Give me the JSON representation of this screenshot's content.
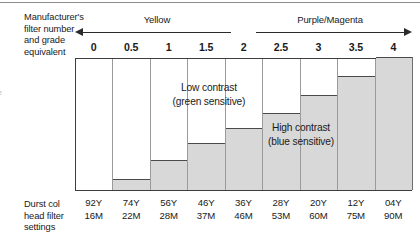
{
  "figure": {
    "left_label_lines": [
      "Manufacturer's",
      "filter number",
      "and grade",
      "equivalent"
    ],
    "bottom_label_lines": [
      "Durst col",
      "head filter",
      "settings"
    ],
    "edge_artifact": "e"
  },
  "bands": [
    {
      "name": "yellow-band",
      "label": "Yellow",
      "arrow": "left",
      "arrow_icon": "arrow-left-icon"
    },
    {
      "name": "purple-band",
      "label": "Purple/Magenta",
      "arrow": "right",
      "arrow_icon": "arrow-right-icon"
    }
  ],
  "annotations": {
    "low_contrast_line1": "Low contrast",
    "low_contrast_line2": "(green sensitive)",
    "high_contrast_line1": "High contrast",
    "high_contrast_line2": "(blue sensitive)"
  },
  "colors": {
    "bar_fill": "#d8d8d8",
    "bar_top_stroke": "#4a4a4a",
    "grid": "#9a9a9a",
    "frame": "#3d3d3d",
    "text": "#1a1a1a"
  },
  "chart_data": {
    "type": "bar",
    "title": "",
    "xlabel": "Manufacturer's filter number and grade equivalent",
    "ylabel": "",
    "categories": [
      "0",
      "0.5",
      "1",
      "1.5",
      "2",
      "2.5",
      "3",
      "3.5",
      "4"
    ],
    "values": [
      0,
      11,
      30,
      46,
      61,
      76,
      94,
      112,
      131
    ],
    "ylim": [
      0,
      131
    ],
    "grid": true,
    "legend": "none",
    "series": [
      {
        "name": "Relative contrast",
        "values": [
          0,
          11,
          30,
          46,
          61,
          76,
          94,
          112,
          131
        ]
      }
    ],
    "annotations": [
      {
        "text": "Low contrast (green sensitive)",
        "region": "left"
      },
      {
        "text": "High contrast (blue sensitive)",
        "region": "right"
      }
    ]
  },
  "filter_settings": {
    "columns": [
      {
        "grade": "0",
        "yellow": "92Y",
        "magenta": "16M"
      },
      {
        "grade": "0.5",
        "yellow": "74Y",
        "magenta": "22M"
      },
      {
        "grade": "1",
        "yellow": "56Y",
        "magenta": "28M"
      },
      {
        "grade": "1.5",
        "yellow": "46Y",
        "magenta": "37M"
      },
      {
        "grade": "2",
        "yellow": "36Y",
        "magenta": "46M"
      },
      {
        "grade": "2.5",
        "yellow": "28Y",
        "magenta": "53M"
      },
      {
        "grade": "3",
        "yellow": "20Y",
        "magenta": "60M"
      },
      {
        "grade": "3.5",
        "yellow": "12Y",
        "magenta": "75M"
      },
      {
        "grade": "4",
        "yellow": "04Y",
        "magenta": "90M"
      }
    ]
  }
}
